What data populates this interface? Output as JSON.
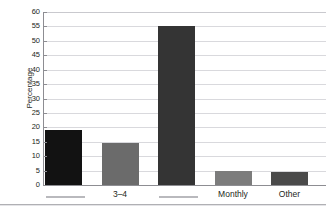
{
  "figure": {
    "clipped_title": "",
    "axis_title": "Percentage"
  },
  "chart_data": {
    "type": "bar",
    "title": "",
    "xlabel": "",
    "ylabel": "Percentage",
    "ylim": [
      0,
      60
    ],
    "ytick_step": 5,
    "yticks": [
      0,
      5,
      10,
      15,
      20,
      25,
      30,
      35,
      40,
      45,
      50,
      55,
      60
    ],
    "grid": "horizontal",
    "legend": "none",
    "categories": [
      "[redacted]",
      "3–4",
      "[redacted]",
      "Monthly",
      "Other"
    ],
    "category_labels_visible": [
      "",
      "3–4",
      "",
      "Monthly",
      "Other"
    ],
    "category_redacted": [
      true,
      false,
      true,
      false,
      false
    ],
    "values": [
      19,
      14.5,
      55,
      4.7,
      4.5
    ],
    "bar_colors": [
      "#121212",
      "#6b6b6b",
      "#343434",
      "#7c7c7c",
      "#4a4a4a"
    ]
  }
}
